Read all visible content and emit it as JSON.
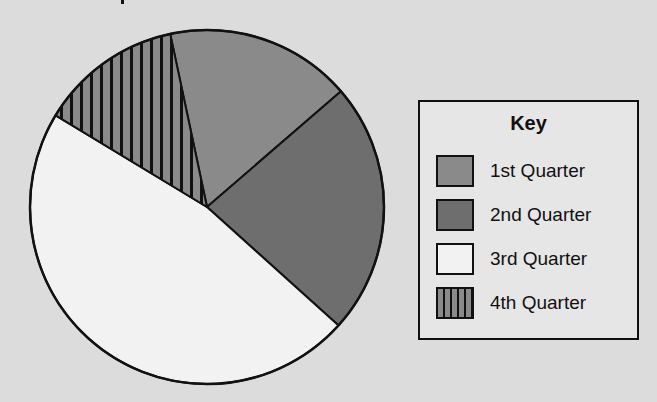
{
  "chart_data": {
    "type": "pie",
    "title": "",
    "legend_title": "Key",
    "legend_position": "right",
    "categories": [
      "1st Quarter",
      "2nd Quarter",
      "3rd Quarter",
      "4th Quarter"
    ],
    "values": [
      17,
      23,
      47,
      13
    ],
    "unit": "percent (estimated from slice angles)",
    "slices": [
      {
        "label": "1st Quarter",
        "value": 17,
        "fill": "#8a8a8a",
        "pattern": "solid"
      },
      {
        "label": "2nd Quarter",
        "value": 23,
        "fill": "#6e6e6e",
        "pattern": "solid"
      },
      {
        "label": "3rd Quarter",
        "value": 47,
        "fill": "#f2f2f2",
        "pattern": "solid"
      },
      {
        "label": "4th Quarter",
        "value": 13,
        "fill": "#8a8a8a",
        "pattern": "vertical-stripes"
      }
    ],
    "start_angle_deg_clockwise_from_top": -12,
    "direction": "clockwise"
  },
  "legend": {
    "title": "Key",
    "items": [
      {
        "label": "1st Quarter"
      },
      {
        "label": "2nd Quarter"
      },
      {
        "label": "3rd Quarter"
      },
      {
        "label": "4th Quarter"
      }
    ]
  },
  "colors": {
    "background": "#dcdcdc",
    "outline": "#111111",
    "q1": "#8a8a8a",
    "q2": "#6e6e6e",
    "q3": "#f2f2f2",
    "q4_base": "#8a8a8a",
    "q4_stripe": "#111111"
  }
}
